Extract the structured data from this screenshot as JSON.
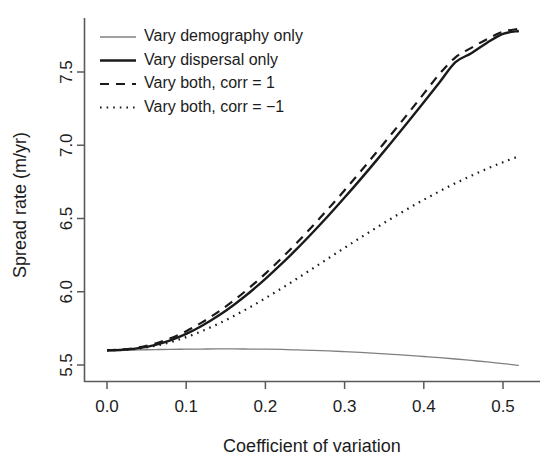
{
  "chart_data": {
    "type": "line",
    "title": "",
    "xlabel": "Coefficient of variation",
    "ylabel": "Spread rate (m/yr)",
    "xlim": [
      0.0,
      0.52
    ],
    "ylim": [
      5.45,
      7.82
    ],
    "xticks": [
      "0.0",
      "0.1",
      "0.2",
      "0.3",
      "0.4",
      "0.5"
    ],
    "xtick_values": [
      0.0,
      0.1,
      0.2,
      0.3,
      0.4,
      0.5
    ],
    "yticks": [
      "5.5",
      "6.0",
      "6.5",
      "7.0",
      "7.5"
    ],
    "ytick_values": [
      5.5,
      6.0,
      6.5,
      7.0,
      7.5
    ],
    "grid": false,
    "legend_position": "top-left",
    "x": [
      0.0,
      0.02,
      0.04,
      0.06,
      0.08,
      0.1,
      0.12,
      0.14,
      0.16,
      0.18,
      0.2,
      0.22,
      0.24,
      0.26,
      0.28,
      0.3,
      0.32,
      0.34,
      0.36,
      0.38,
      0.4,
      0.42,
      0.44,
      0.46,
      0.48,
      0.5,
      0.52
    ],
    "series": [
      {
        "name": "Vary demography only",
        "style": "solid-thin",
        "color": "#808080",
        "values": [
          5.6,
          5.601,
          5.603,
          5.605,
          5.607,
          5.608,
          5.609,
          5.61,
          5.61,
          5.609,
          5.608,
          5.606,
          5.603,
          5.6,
          5.596,
          5.591,
          5.586,
          5.58,
          5.573,
          5.566,
          5.558,
          5.55,
          5.541,
          5.531,
          5.521,
          5.51,
          5.497
        ]
      },
      {
        "name": "Vary dispersal only",
        "style": "solid-thick",
        "color": "#1a1a1a",
        "values": [
          5.6,
          5.604,
          5.615,
          5.636,
          5.668,
          5.712,
          5.768,
          5.834,
          5.91,
          5.995,
          6.088,
          6.188,
          6.294,
          6.406,
          6.522,
          6.643,
          6.767,
          6.895,
          7.026,
          7.159,
          7.294,
          7.43,
          7.567,
          7.628,
          7.7,
          7.76,
          7.78
        ]
      },
      {
        "name": "Vary both, corr = 1",
        "style": "dashed",
        "color": "#1a1a1a",
        "values": [
          5.6,
          5.606,
          5.62,
          5.645,
          5.682,
          5.731,
          5.791,
          5.861,
          5.94,
          6.028,
          6.124,
          6.227,
          6.336,
          6.451,
          6.57,
          6.693,
          6.82,
          6.95,
          7.082,
          7.216,
          7.352,
          7.488,
          7.6,
          7.665,
          7.725,
          7.775,
          7.795
        ]
      },
      {
        "name": "Vary both, corr = −1",
        "style": "dotted",
        "color": "#1a1a1a",
        "values": [
          5.6,
          5.603,
          5.612,
          5.63,
          5.656,
          5.69,
          5.732,
          5.78,
          5.834,
          5.893,
          5.956,
          6.022,
          6.09,
          6.16,
          6.23,
          6.3,
          6.369,
          6.437,
          6.503,
          6.567,
          6.628,
          6.686,
          6.741,
          6.792,
          6.84,
          6.884,
          6.925
        ]
      }
    ]
  },
  "legend": {
    "entries": [
      {
        "label": "Vary demography only"
      },
      {
        "label": "Vary dispersal only"
      },
      {
        "label": "Vary both, corr = 1"
      },
      {
        "label": "Vary both, corr = −1"
      }
    ]
  },
  "axes": {
    "x_title": "Coefficient of variation",
    "y_title": "Spread rate (m/yr)"
  }
}
